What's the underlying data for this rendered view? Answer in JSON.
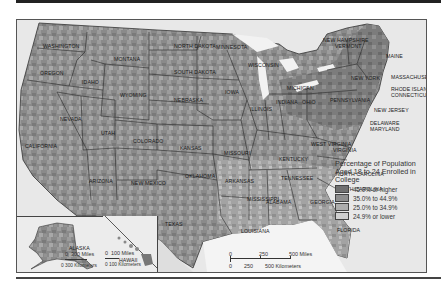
{
  "map": {
    "title": "Percentage of Population Aged 18 to 24 Enrolled in College",
    "states": [
      {
        "name": "WASHINGTON",
        "x": 26,
        "y": 24
      },
      {
        "name": "OREGON",
        "x": 23,
        "y": 51
      },
      {
        "name": "IDAHO",
        "x": 65,
        "y": 60
      },
      {
        "name": "MONTANA",
        "x": 97,
        "y": 37
      },
      {
        "name": "WYOMING",
        "x": 103,
        "y": 73
      },
      {
        "name": "NORTH DAKOTA",
        "x": 157,
        "y": 24
      },
      {
        "name": "SOUTH DAKOTA",
        "x": 157,
        "y": 50
      },
      {
        "name": "MINNESOTA",
        "x": 199,
        "y": 25
      },
      {
        "name": "WISCONSIN",
        "x": 231,
        "y": 43
      },
      {
        "name": "MICHIGAN",
        "x": 270,
        "y": 66
      },
      {
        "name": "NEBRASKA",
        "x": 157,
        "y": 78
      },
      {
        "name": "IOWA",
        "x": 208,
        "y": 70
      },
      {
        "name": "ILLINOIS",
        "x": 233,
        "y": 87
      },
      {
        "name": "INDIANA",
        "x": 259,
        "y": 80
      },
      {
        "name": "OHIO",
        "x": 285,
        "y": 80
      },
      {
        "name": "PENNSYLVANIA",
        "x": 313,
        "y": 78
      },
      {
        "name": "NEW YORK",
        "x": 334,
        "y": 56
      },
      {
        "name": "NEVADA",
        "x": 43,
        "y": 97
      },
      {
        "name": "CALIFORNIA",
        "x": 8,
        "y": 124
      },
      {
        "name": "UTAH",
        "x": 84,
        "y": 111
      },
      {
        "name": "COLORADO",
        "x": 116,
        "y": 119
      },
      {
        "name": "KANSAS",
        "x": 163,
        "y": 126
      },
      {
        "name": "MISSOURI",
        "x": 207,
        "y": 131
      },
      {
        "name": "KENTUCKY",
        "x": 262,
        "y": 137
      },
      {
        "name": "WEST VIRGINIA",
        "x": 294,
        "y": 122
      },
      {
        "name": "VIRGINIA",
        "x": 316,
        "y": 128
      },
      {
        "name": "ARIZONA",
        "x": 72,
        "y": 159
      },
      {
        "name": "NEW MEXICO",
        "x": 114,
        "y": 161
      },
      {
        "name": "OKLAHOMA",
        "x": 168,
        "y": 154
      },
      {
        "name": "ARKANSAS",
        "x": 208,
        "y": 159
      },
      {
        "name": "TENNESSEE",
        "x": 264,
        "y": 156
      },
      {
        "name": "NORTH CAROLINA",
        "x": 319,
        "y": 152
      },
      {
        "name": "SOUTH CAROLINA",
        "x": 318,
        "y": 167
      },
      {
        "name": "MISSISSIPPI",
        "x": 230,
        "y": 177
      },
      {
        "name": "ALABAMA",
        "x": 249,
        "y": 180
      },
      {
        "name": "GEORGIA",
        "x": 293,
        "y": 180
      },
      {
        "name": "TEXAS",
        "x": 148,
        "y": 202
      },
      {
        "name": "LOUISIANA",
        "x": 224,
        "y": 209
      },
      {
        "name": "FLORIDA",
        "x": 320,
        "y": 208
      },
      {
        "name": "MAINE",
        "x": 369,
        "y": 34
      },
      {
        "name": "ALASKA",
        "x": 52,
        "y": 226
      },
      {
        "name": "HAWAII",
        "x": 102,
        "y": 238
      }
    ],
    "callouts": [
      {
        "name": "NEW HAMPSHIRE",
        "x": 306,
        "y": 18
      },
      {
        "name": "VERMONT",
        "x": 318,
        "y": 24
      },
      {
        "name": "MASSACHUSETTS",
        "x": 374,
        "y": 55
      },
      {
        "name": "RHODE ISLAND",
        "x": 374,
        "y": 67
      },
      {
        "name": "CONNECTICUT",
        "x": 374,
        "y": 73
      },
      {
        "name": "NEW JERSEY",
        "x": 357,
        "y": 88
      },
      {
        "name": "DELAWARE",
        "x": 353,
        "y": 101
      },
      {
        "name": "MARYLAND",
        "x": 353,
        "y": 107
      }
    ]
  },
  "legend": {
    "title": "Percentage of Population Aged 18 to 24 Enrolled in College",
    "items": [
      {
        "label": "45.0% or higher",
        "color": "#707070"
      },
      {
        "label": "35.0% to 44.9%",
        "color": "#8e8e8e"
      },
      {
        "label": "25.0% to 34.9%",
        "color": "#adadad"
      },
      {
        "label": "24.9% or lower",
        "color": "#d0d0d0"
      }
    ]
  },
  "scale_main": {
    "miles": [
      "0",
      "250",
      "500 Miles"
    ],
    "km": [
      "0",
      "250",
      "500 Kilometers"
    ]
  },
  "scale_alaska": {
    "miles": [
      "0",
      "300 Miles"
    ],
    "km": "0 300 Kilometers"
  },
  "scale_hawaii": {
    "miles": [
      "0",
      "100 Miles"
    ],
    "km": "0 100 Kilometers"
  }
}
